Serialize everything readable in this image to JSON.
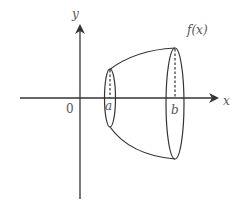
{
  "diagram": {
    "axes": {
      "x_label": "x",
      "y_label": "y",
      "origin_label": "0"
    },
    "labels": {
      "a": "a",
      "b": "b",
      "function": "f(x)"
    },
    "colors": {
      "stroke": "#333333",
      "text": "#555555",
      "background": "#ffffff"
    }
  }
}
